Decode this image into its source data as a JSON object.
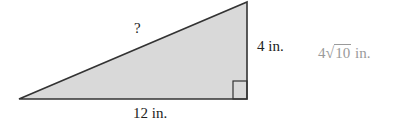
{
  "diagram": {
    "type": "right-triangle",
    "fill_color": "#d9d9d9",
    "stroke_color": "#333333",
    "hypotenuse_label": "?",
    "vertical_leg_label": "4 in.",
    "horizontal_leg_label": "12 in.",
    "answer": {
      "coefficient": "4",
      "radical_symbol": "√",
      "radicand": "10",
      "unit": "in.",
      "color": "#9a9a9a"
    }
  }
}
